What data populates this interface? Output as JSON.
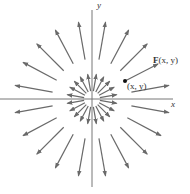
{
  "diagram": {
    "axes": {
      "x_label": "x",
      "y_label": "y"
    },
    "labels": {
      "vector": "F",
      "vector_args": "(x, y)",
      "point": "(x, y)"
    },
    "origin": [
      92,
      99
    ],
    "arrow_angles_deg": [
      10,
      28,
      45,
      62,
      80,
      100,
      118,
      135,
      152,
      170,
      190,
      208,
      225,
      242,
      260,
      280,
      298,
      315,
      332,
      350
    ],
    "inner_ring": {
      "r_start": 8,
      "r_end": 25
    },
    "outer_ring": {
      "r_start": 40,
      "r_end": 78
    },
    "highlight_vector": {
      "from": [
        125,
        81
      ],
      "to": [
        158,
        64
      ]
    },
    "colors": {
      "arrow": "#6a6a6a",
      "axis": "#777777",
      "text": "#333333"
    }
  }
}
